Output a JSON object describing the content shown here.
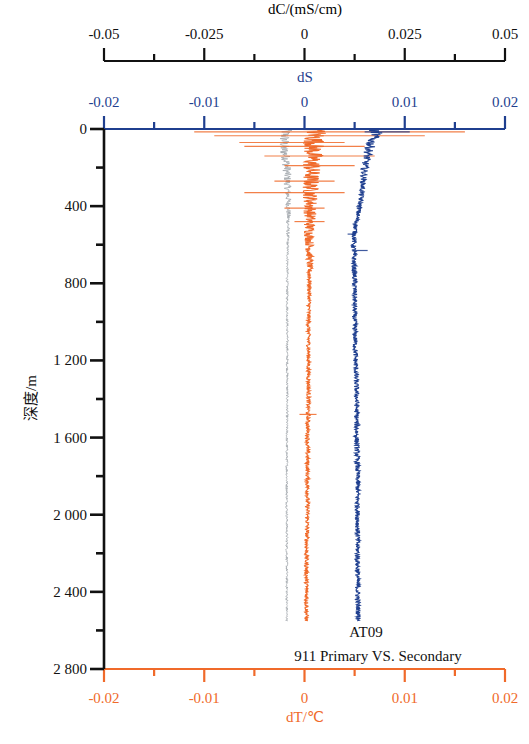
{
  "chart_data": {
    "type": "line",
    "subtype": "vertical depth profiles",
    "annotation": [
      "AT09",
      "911 Primary VS. Secondary"
    ],
    "y_axis": {
      "label": "深度/m",
      "range": [
        0,
        2800
      ],
      "inverted": true,
      "major_ticks": [
        0,
        400,
        800,
        1200,
        1600,
        2000,
        2400,
        2800
      ],
      "tick_labels": [
        "0",
        "400",
        "800",
        "1 200",
        "1 600",
        "2 000",
        "2 400",
        "2 800"
      ],
      "minor_ticks": [
        200,
        600,
        1000,
        1400,
        1800,
        2200,
        2600
      ],
      "color": "#111111"
    },
    "x_axes": [
      {
        "id": "dC",
        "label": "dC/(mS/cm)",
        "position": "top-outer",
        "range": [
          -0.05,
          0.05
        ],
        "major_ticks": [
          -0.05,
          -0.025,
          0,
          0.025,
          0.05
        ],
        "tick_labels": [
          "-0.05",
          "-0.025",
          "0",
          "0.025",
          "0.05"
        ],
        "minor_ticks": [
          -0.0375,
          -0.0125,
          0.0125,
          0.0375
        ],
        "color": "#111111"
      },
      {
        "id": "dS",
        "label": "dS",
        "position": "top-inner",
        "range": [
          -0.02,
          0.02
        ],
        "major_ticks": [
          -0.02,
          -0.01,
          0,
          0.01,
          0.02
        ],
        "tick_labels": [
          "-0.02",
          "-0.01",
          "0",
          "0.01",
          "0.02"
        ],
        "minor_ticks": [
          -0.015,
          -0.005,
          0.005,
          0.015
        ],
        "color": "#1f3f8f"
      },
      {
        "id": "dT",
        "label": "dT/℃",
        "position": "bottom",
        "range": [
          -0.02,
          0.02
        ],
        "major_ticks": [
          -0.02,
          -0.01,
          0,
          0.01,
          0.02
        ],
        "tick_labels": [
          "-0.02",
          "-0.01",
          "0",
          "0.01",
          "0.02"
        ],
        "minor_ticks": [
          -0.015,
          -0.005,
          0.005,
          0.015
        ],
        "color": "#f06a2a"
      }
    ],
    "series": [
      {
        "name": "dC",
        "axis": "dC",
        "color": "#9aa0a6",
        "depth": [
          0,
          20,
          50,
          100,
          150,
          200,
          300,
          400,
          500,
          600,
          800,
          1000,
          1200,
          1400,
          1600,
          1800,
          2000,
          2200,
          2400,
          2550
        ],
        "values": [
          -0.0045,
          -0.0048,
          -0.005,
          -0.0052,
          -0.0046,
          -0.0044,
          -0.0042,
          -0.004,
          -0.0041,
          -0.0042,
          -0.0043,
          -0.0043,
          -0.0043,
          -0.0043,
          -0.0044,
          -0.0044,
          -0.0044,
          -0.0044,
          -0.0044,
          -0.0044
        ],
        "noise_amplitude_upper": 0.0015,
        "noise_amplitude_lower": 0.0003,
        "noise_transition_depth": 600
      },
      {
        "name": "dT",
        "axis": "dT",
        "color": "#f06a2a",
        "depth": [
          0,
          20,
          50,
          100,
          150,
          200,
          300,
          400,
          500,
          600,
          800,
          1000,
          1200,
          1400,
          1600,
          1800,
          2000,
          2200,
          2400,
          2550
        ],
        "values": [
          0.0008,
          0.0012,
          0.001,
          0.0009,
          0.0008,
          0.0007,
          0.0006,
          0.0006,
          0.0005,
          0.0005,
          0.0005,
          0.0004,
          0.0004,
          0.0004,
          0.0003,
          0.0003,
          0.0003,
          0.0002,
          0.0002,
          0.0002
        ],
        "noise_amplitude_upper": 0.0012,
        "noise_amplitude_lower": 0.0002,
        "noise_transition_depth": 800,
        "spikes": [
          {
            "depth": 15,
            "min": -0.011,
            "max": 0.016
          },
          {
            "depth": 35,
            "min": -0.009,
            "max": 0.012
          },
          {
            "depth": 70,
            "min": -0.0065,
            "max": 0.004
          },
          {
            "depth": 90,
            "min": -0.006,
            "max": 0.006
          },
          {
            "depth": 140,
            "min": -0.004,
            "max": 0.007
          },
          {
            "depth": 190,
            "min": -0.002,
            "max": 0.005
          },
          {
            "depth": 270,
            "min": -0.003,
            "max": 0.003
          },
          {
            "depth": 330,
            "min": -0.006,
            "max": 0.004
          },
          {
            "depth": 410,
            "min": -0.002,
            "max": 0.002
          },
          {
            "depth": 480,
            "min": -0.001,
            "max": 0.002
          },
          {
            "depth": 1480,
            "min": -0.0005,
            "max": 0.0012
          }
        ]
      },
      {
        "name": "dS",
        "axis": "dS",
        "color": "#1f3f8f",
        "depth": [
          0,
          20,
          50,
          100,
          150,
          200,
          300,
          400,
          500,
          600,
          800,
          1000,
          1200,
          1400,
          1600,
          1800,
          2000,
          2200,
          2400,
          2550
        ],
        "values": [
          0.0068,
          0.0072,
          0.0068,
          0.0065,
          0.0062,
          0.006,
          0.0058,
          0.0055,
          0.0051,
          0.0049,
          0.005,
          0.005,
          0.0051,
          0.0052,
          0.0052,
          0.0053,
          0.0053,
          0.0053,
          0.0053,
          0.0054
        ],
        "noise_amplitude_upper": 0.0006,
        "noise_amplitude_lower": 0.00025,
        "noise_transition_depth": 300,
        "spikes": [
          {
            "depth": 15,
            "min": 0.006,
            "max": 0.0105
          },
          {
            "depth": 545,
            "min": 0.0043,
            "max": 0.005
          },
          {
            "depth": 630,
            "min": 0.0049,
            "max": 0.0063
          }
        ]
      }
    ]
  }
}
